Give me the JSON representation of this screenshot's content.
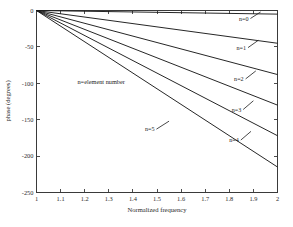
{
  "figure": {
    "background_color": "#ffffff",
    "axes_color": "#3a3a3a",
    "line_color": "#1a1a1a"
  },
  "chart_data": {
    "type": "line",
    "title": "",
    "subtitle": "",
    "xlabel": "Normalized frequency",
    "ylabel": "phase (degrees)",
    "xlim": [
      1,
      2
    ],
    "ylim": [
      -250,
      0
    ],
    "xticks": [
      1,
      1.1,
      1.2,
      1.3,
      1.4,
      1.5,
      1.6,
      1.7,
      1.8,
      1.9,
      2
    ],
    "xticklabels": [
      "1",
      "1.1",
      "1.2",
      "1.3",
      "1.4",
      "1.5",
      "1.6",
      "1.7",
      "1.8",
      "1.9",
      "2"
    ],
    "yticks": [
      0,
      -50,
      -100,
      -150,
      -200,
      -250
    ],
    "yticklabels": [
      "0",
      "-50",
      "-100",
      "-150",
      "-200",
      "-250"
    ],
    "grid": false,
    "legend_position": "inline-annotations",
    "box_frame": true,
    "ticks_all_sides": true,
    "annotations": [
      {
        "name": "element-number-note",
        "text": "n=element number",
        "x": 1.17,
        "y": -101
      }
    ],
    "series": [
      {
        "name": "n=0",
        "label": "n=0",
        "x": [
          1,
          2
        ],
        "values": [
          0,
          -5
        ],
        "label_x": 1.84,
        "label_y": -14,
        "leader_to_x": 1.93,
        "leader_to_y": -2
      },
      {
        "name": "n=1",
        "label": "n=1",
        "x": [
          1,
          2
        ],
        "values": [
          0,
          -45
        ],
        "label_x": 1.83,
        "label_y": -54,
        "leader_to_x": 1.92,
        "leader_to_y": -41
      },
      {
        "name": "n=2",
        "label": "n=2",
        "x": [
          1,
          2
        ],
        "values": [
          0,
          -88
        ],
        "label_x": 1.82,
        "label_y": -97,
        "leader_to_x": 1.91,
        "leader_to_y": -83
      },
      {
        "name": "n=3",
        "label": "n=3",
        "x": [
          1,
          2
        ],
        "values": [
          0,
          -130
        ],
        "label_x": 1.81,
        "label_y": -139,
        "leader_to_x": 1.9,
        "leader_to_y": -124
      },
      {
        "name": "n=4",
        "label": "n=4",
        "x": [
          1,
          2
        ],
        "values": [
          0,
          -172
        ],
        "label_x": 1.8,
        "label_y": -181,
        "leader_to_x": 1.89,
        "leader_to_y": -166
      },
      {
        "name": "n=5",
        "label": "n=5",
        "x": [
          1,
          2
        ],
        "values": [
          0,
          -215
        ],
        "label_x": 1.45,
        "label_y": -166,
        "leader_to_x": 1.55,
        "leader_to_y": -152
      }
    ]
  }
}
